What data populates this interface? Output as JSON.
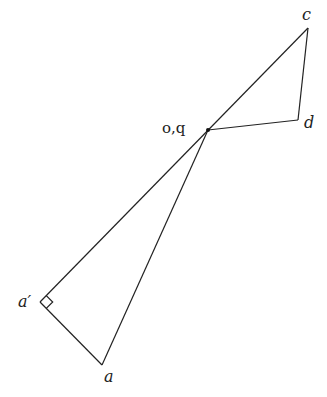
{
  "diagram": {
    "points": {
      "c": {
        "x": 308,
        "y": 28,
        "label": "c"
      },
      "d": {
        "x": 298,
        "y": 120,
        "label": "d"
      },
      "oq": {
        "x": 208,
        "y": 130,
        "label": "o,q"
      },
      "a_prime": {
        "x": 40,
        "y": 302,
        "label": "a′"
      },
      "a": {
        "x": 102,
        "y": 365,
        "label": "a"
      }
    },
    "segments": [
      [
        "a_prime",
        "c"
      ],
      [
        "c",
        "d"
      ],
      [
        "d",
        "oq"
      ],
      [
        "oq",
        "a"
      ],
      [
        "a_prime",
        "a"
      ]
    ],
    "right_angle_marker": "a_prime",
    "line_color": "#222222"
  }
}
